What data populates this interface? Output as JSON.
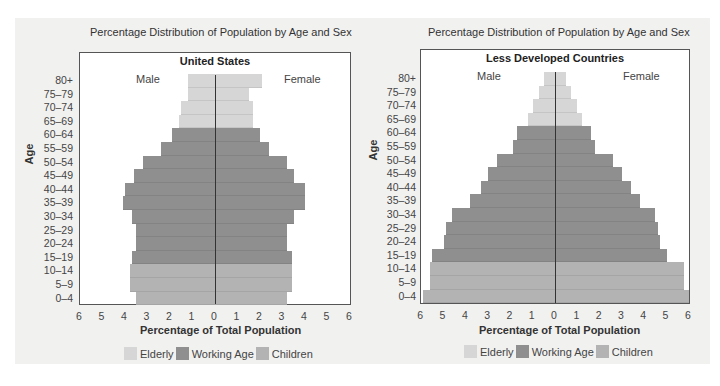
{
  "colors": {
    "elderly": "#d6d6d6",
    "working_age": "#8f8f8f",
    "children": "#b3b3b3",
    "background": "#f1f1f0",
    "plot_bg": "#ffffff"
  },
  "legend": [
    {
      "key": "elderly",
      "label": "Elderly"
    },
    {
      "key": "working_age",
      "label": "Working Age"
    },
    {
      "key": "children",
      "label": "Children"
    }
  ],
  "age_groups": [
    "80+",
    "75–79",
    "70–74",
    "65–69",
    "60–64",
    "55–59",
    "50–54",
    "45–49",
    "40–44",
    "35–39",
    "30–34",
    "25–29",
    "20–24",
    "15–19",
    "10–14",
    "5–9",
    "0–4"
  ],
  "age_categories": [
    "elderly",
    "elderly",
    "elderly",
    "elderly",
    "working_age",
    "working_age",
    "working_age",
    "working_age",
    "working_age",
    "working_age",
    "working_age",
    "working_age",
    "working_age",
    "working_age",
    "children",
    "children",
    "children"
  ],
  "x_ticks": [
    "6",
    "5",
    "4",
    "3",
    "2",
    "1",
    "0",
    "1",
    "2",
    "3",
    "4",
    "5",
    "6"
  ],
  "chart_data": [
    {
      "type": "bar",
      "orientation": "horizontal-population-pyramid",
      "suptitle": "Percentage Distribution of Population by Age and Sex",
      "title": "United States",
      "left_label": "Male",
      "right_label": "Female",
      "xlabel": "Percentage of Total Population",
      "ylabel": "Age",
      "xlim": [
        -6,
        6
      ],
      "categories": [
        "80+",
        "75–79",
        "70–74",
        "65–69",
        "60–64",
        "55–59",
        "50–54",
        "45–49",
        "40–44",
        "35–39",
        "30–34",
        "25–29",
        "20–24",
        "15–19",
        "10–14",
        "5–9",
        "0–4"
      ],
      "series": [
        {
          "name": "Male",
          "values": [
            1.2,
            1.2,
            1.5,
            1.6,
            1.9,
            2.4,
            3.2,
            3.6,
            4.0,
            4.1,
            3.7,
            3.5,
            3.5,
            3.7,
            3.8,
            3.8,
            3.5
          ]
        },
        {
          "name": "Female",
          "values": [
            2.1,
            1.5,
            1.7,
            1.7,
            2.0,
            2.4,
            3.2,
            3.5,
            4.0,
            4.0,
            3.5,
            3.2,
            3.2,
            3.4,
            3.4,
            3.4,
            3.2
          ]
        }
      ],
      "legend": [
        "Elderly",
        "Working Age",
        "Children"
      ],
      "grid": false
    },
    {
      "type": "bar",
      "orientation": "horizontal-population-pyramid",
      "suptitle": "Percentage Distribution of Population by Age and Sex",
      "title": "Less Developed Countries",
      "left_label": "Male",
      "right_label": "Female",
      "xlabel": "Percentage of Total Population",
      "ylabel": "Age",
      "xlim": [
        -6,
        6
      ],
      "categories": [
        "80+",
        "75–79",
        "70–74",
        "65–69",
        "60–64",
        "55–59",
        "50–54",
        "45–49",
        "40–44",
        "35–39",
        "30–34",
        "25–29",
        "20–24",
        "15–19",
        "10–14",
        "5–9",
        "0–4"
      ],
      "series": [
        {
          "name": "Male",
          "values": [
            0.5,
            0.7,
            1.0,
            1.2,
            1.7,
            1.9,
            2.6,
            3.0,
            3.3,
            3.8,
            4.6,
            4.9,
            5.0,
            5.5,
            5.6,
            5.6,
            5.9
          ]
        },
        {
          "name": "Female",
          "values": [
            0.5,
            0.7,
            1.0,
            1.2,
            1.6,
            1.8,
            2.6,
            3.0,
            3.4,
            3.8,
            4.5,
            4.6,
            4.7,
            5.0,
            5.8,
            5.8,
            6.0
          ]
        }
      ],
      "legend": [
        "Elderly",
        "Working Age",
        "Children"
      ],
      "grid": false
    }
  ],
  "panels": {
    "us": {
      "suptitle": "Percentage Distribution of Population by Age and Sex",
      "title": "United States",
      "male": "Male",
      "female": "Female",
      "ylabel": "Age",
      "xlabel": "Percentage of Total Population"
    },
    "ldc": {
      "suptitle": "Percentage Distribution of Population by Age and Sex",
      "title": "Less Developed Countries",
      "male": "Male",
      "female": "Female",
      "ylabel": "Age",
      "xlabel": "Percentage of Total Population"
    }
  }
}
